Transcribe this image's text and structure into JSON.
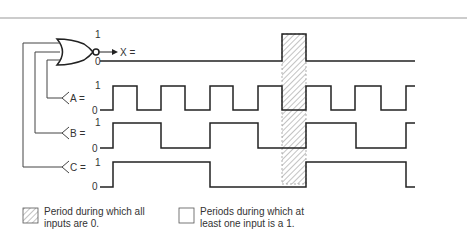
{
  "diagram": {
    "type": "NOR gate timing diagram",
    "gate": {
      "kind": "NOR",
      "inputs": [
        "A",
        "B",
        "C"
      ],
      "output": "X"
    },
    "signals": [
      {
        "name": "X",
        "label": "X =",
        "high_label": "1",
        "low_label": "0",
        "transitions": [
          [
            100,
            0
          ],
          [
            282,
            1
          ],
          [
            306,
            0
          ],
          [
            415,
            0
          ]
        ]
      },
      {
        "name": "A",
        "label": "A =",
        "high_label": "1",
        "low_label": "0",
        "transitions": [
          [
            100,
            0
          ],
          [
            113,
            1
          ],
          [
            137,
            0
          ],
          [
            161,
            1
          ],
          [
            185,
            0
          ],
          [
            210,
            1
          ],
          [
            233,
            0
          ],
          [
            258,
            1
          ],
          [
            282,
            0
          ],
          [
            306,
            1
          ],
          [
            331,
            0
          ],
          [
            355,
            1
          ],
          [
            381,
            0
          ],
          [
            406,
            1
          ],
          [
            415,
            1
          ]
        ]
      },
      {
        "name": "B",
        "label": "B =",
        "high_label": "1",
        "low_label": "0",
        "transitions": [
          [
            100,
            0
          ],
          [
            113,
            1
          ],
          [
            161,
            0
          ],
          [
            210,
            1
          ],
          [
            258,
            0
          ],
          [
            306,
            1
          ],
          [
            356,
            0
          ],
          [
            406,
            1
          ],
          [
            415,
            1
          ]
        ]
      },
      {
        "name": "C",
        "label": "C =",
        "high_label": "1",
        "low_label": "0",
        "transitions": [
          [
            100,
            0
          ],
          [
            113,
            1
          ],
          [
            210,
            0
          ],
          [
            306,
            1
          ],
          [
            406,
            0
          ],
          [
            415,
            0
          ]
        ]
      }
    ],
    "hatched_region": {
      "x_start": 282,
      "x_end": 306
    },
    "legend": [
      {
        "swatch": "hatched",
        "line1": "Period during which all",
        "line2": "inputs are 0."
      },
      {
        "swatch": "empty",
        "line1": "Periods during which at",
        "line2": "least one input is a 1."
      }
    ]
  }
}
